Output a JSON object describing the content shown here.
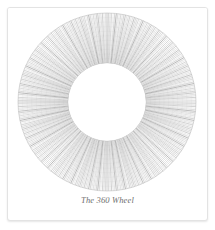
{
  "card": {
    "background_color": "#ffffff",
    "border_color": "#e3e3e3"
  },
  "figure": {
    "name": "the-360-wheel",
    "caption": "The 360 Wheel"
  },
  "chart_data": {
    "type": "pie",
    "title": "The 360 Wheel",
    "subtitle": "",
    "xlabel": "",
    "ylabel": "",
    "categories": [
      "0° – 359°"
    ],
    "values": [
      360
    ],
    "spoke_count": 360,
    "degrees_per_spoke": 1,
    "center_x": 100,
    "center_y": 94,
    "outer_radius": 89,
    "inner_radius": 39,
    "start_angle_deg": 0,
    "end_angle_deg": 360,
    "ring_count": 11,
    "grid": false,
    "legend": "none",
    "stroke_colors": [
      "#8a8a8a",
      "#9a9a9a",
      "#a6a6a6",
      "#b2b2b2",
      "#bcbcbc",
      "#909090"
    ],
    "ring_color": "#b9b9b9",
    "background_color": "#ffffff",
    "caption_color": "#6e6e6e"
  }
}
